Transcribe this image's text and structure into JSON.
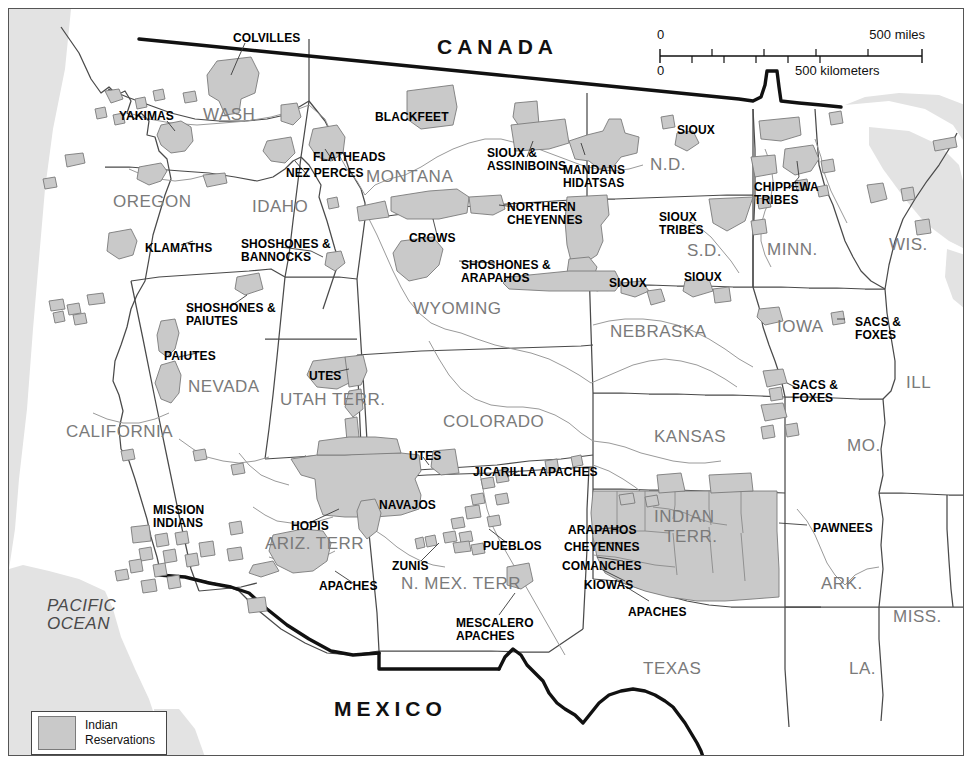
{
  "map": {
    "title_countries": [
      {
        "name": "canada",
        "label": "CANADA",
        "x": 428,
        "y": 26
      },
      {
        "name": "mexico",
        "label": "MEXICO",
        "x": 325,
        "y": 688
      }
    ],
    "scale_bar": {
      "miles_zero": "0",
      "miles_max": "500 miles",
      "km_zero": "0",
      "km_max": "500 kilometers"
    },
    "legend": {
      "swatch_color": "#c9c9c9",
      "label_line1": "Indian",
      "label_line2": "Reservations"
    },
    "ocean_label": {
      "line1": "PACIFIC",
      "line2": "OCEAN",
      "x": 38,
      "y": 588
    },
    "states": [
      {
        "label": "WASH",
        "x": 194,
        "y": 96,
        "size": 17
      },
      {
        "label": "OREGON",
        "x": 104,
        "y": 183,
        "size": 17
      },
      {
        "label": "IDAHO",
        "x": 243,
        "y": 188,
        "size": 17
      },
      {
        "label": "MONTANA",
        "x": 357,
        "y": 158,
        "size": 17
      },
      {
        "label": "N.D.",
        "x": 641,
        "y": 146,
        "size": 17
      },
      {
        "label": "S.D.",
        "x": 678,
        "y": 232,
        "size": 17
      },
      {
        "label": "MINN.",
        "x": 758,
        "y": 231,
        "size": 17
      },
      {
        "label": "WIS.",
        "x": 880,
        "y": 226,
        "size": 17
      },
      {
        "label": "WYOMING",
        "x": 404,
        "y": 290,
        "size": 17
      },
      {
        "label": "NEBRASKA",
        "x": 601,
        "y": 313,
        "size": 17
      },
      {
        "label": "IOWA",
        "x": 768,
        "y": 308,
        "size": 17
      },
      {
        "label": "ILL",
        "x": 897,
        "y": 364,
        "size": 17
      },
      {
        "label": "NEVADA",
        "x": 179,
        "y": 368,
        "size": 17
      },
      {
        "label": "UTAH TERR.",
        "x": 271,
        "y": 381,
        "size": 17
      },
      {
        "label": "COLORADO",
        "x": 434,
        "y": 403,
        "size": 17
      },
      {
        "label": "KANSAS",
        "x": 645,
        "y": 418,
        "size": 17
      },
      {
        "label": "MO.",
        "x": 838,
        "y": 427,
        "size": 17
      },
      {
        "label": "CALIFORNIA",
        "x": 57,
        "y": 413,
        "size": 17
      },
      {
        "label": "ARIZ. TERR",
        "x": 256,
        "y": 525,
        "size": 17
      },
      {
        "label": "N. MEX. TERR",
        "x": 392,
        "y": 565,
        "size": 17
      },
      {
        "label": "INDIAN",
        "x": 645,
        "y": 498,
        "size": 17
      },
      {
        "label": "TERR.",
        "x": 655,
        "y": 518,
        "size": 17
      },
      {
        "label": "ARK.",
        "x": 812,
        "y": 565,
        "size": 17
      },
      {
        "label": "MISS.",
        "x": 884,
        "y": 598,
        "size": 17
      },
      {
        "label": "LA.",
        "x": 840,
        "y": 650,
        "size": 17
      },
      {
        "label": "TEXAS",
        "x": 634,
        "y": 650,
        "size": 17
      }
    ],
    "tribes": [
      {
        "label": "COLVILLES",
        "x": 224,
        "y": 23,
        "align": "left"
      },
      {
        "label": "YAKIMAS",
        "x": 110,
        "y": 101,
        "align": "left"
      },
      {
        "label": "BLACKFEET",
        "x": 366,
        "y": 102,
        "align": "left"
      },
      {
        "label": "SIOUX",
        "x": 668,
        "y": 115,
        "align": "left"
      },
      {
        "label": "FLATHEADS",
        "x": 304,
        "y": 142,
        "align": "left"
      },
      {
        "label": "NEZ PERCES",
        "x": 277,
        "y": 158,
        "align": "left"
      },
      {
        "label": "SIOUX &|ASSINIBOINS",
        "x": 478,
        "y": 138,
        "align": "left"
      },
      {
        "label": "MANDANS|HIDATSAS",
        "x": 554,
        "y": 155,
        "align": "left"
      },
      {
        "label": "CHIPPEWA|TRIBES",
        "x": 745,
        "y": 172,
        "align": "left"
      },
      {
        "label": "NORTHERN|CHEYENNES",
        "x": 498,
        "y": 192,
        "align": "left"
      },
      {
        "label": "SIOUX|TRIBES",
        "x": 650,
        "y": 202,
        "align": "left"
      },
      {
        "label": "SHOSHONES &|BANNOCKS",
        "x": 232,
        "y": 229,
        "align": "left"
      },
      {
        "label": "CROWS",
        "x": 400,
        "y": 223,
        "align": "left"
      },
      {
        "label": "KLAMATHS",
        "x": 136,
        "y": 233,
        "align": "left"
      },
      {
        "label": "SHOSHONES &|ARAPAHOS",
        "x": 452,
        "y": 250,
        "align": "left"
      },
      {
        "label": "SIOUX",
        "x": 600,
        "y": 268,
        "align": "left"
      },
      {
        "label": "SIOUX",
        "x": 675,
        "y": 262,
        "align": "left"
      },
      {
        "label": "SHOSHONES &|PAIUTES",
        "x": 177,
        "y": 293,
        "align": "left"
      },
      {
        "label": "SACS &|FOXES",
        "x": 846,
        "y": 307,
        "align": "left"
      },
      {
        "label": "PAIUTES",
        "x": 155,
        "y": 341,
        "align": "left"
      },
      {
        "label": "UTES",
        "x": 300,
        "y": 361,
        "align": "left"
      },
      {
        "label": "SACS &|FOXES",
        "x": 783,
        "y": 370,
        "align": "left"
      },
      {
        "label": "UTES",
        "x": 400,
        "y": 441,
        "align": "left"
      },
      {
        "label": "JICARILLA APACHES",
        "x": 464,
        "y": 457,
        "align": "left"
      },
      {
        "label": "MISSION|INDIANS",
        "x": 144,
        "y": 495,
        "align": "left"
      },
      {
        "label": "NAVAJOS",
        "x": 370,
        "y": 490,
        "align": "left"
      },
      {
        "label": "HOPIS",
        "x": 282,
        "y": 511,
        "align": "left"
      },
      {
        "label": "PUEBLOS",
        "x": 474,
        "y": 531,
        "align": "left"
      },
      {
        "label": "PAWNEES",
        "x": 804,
        "y": 513,
        "align": "left"
      },
      {
        "label": "ARAPAHOS",
        "x": 559,
        "y": 515,
        "align": "left"
      },
      {
        "label": "CHEYENNES",
        "x": 555,
        "y": 532,
        "align": "left"
      },
      {
        "label": "ZUNIS",
        "x": 383,
        "y": 551,
        "align": "left"
      },
      {
        "label": "COMANCHES",
        "x": 553,
        "y": 551,
        "align": "left"
      },
      {
        "label": "KIOWAS",
        "x": 575,
        "y": 570,
        "align": "left"
      },
      {
        "label": "APACHES",
        "x": 310,
        "y": 571,
        "align": "left"
      },
      {
        "label": "APACHES",
        "x": 619,
        "y": 597,
        "align": "left"
      },
      {
        "label": "MESCALERO|APACHES",
        "x": 447,
        "y": 608,
        "align": "left"
      }
    ],
    "colors": {
      "reservation_fill": "#c9c9c9",
      "reservation_stroke": "#7b7b7b",
      "state_line": "#4a4a4a",
      "border_line": "#111111",
      "river_line": "#8a8a8a",
      "ocean_fill": "#e2e2e2",
      "state_label": "#7a7a7a"
    }
  }
}
